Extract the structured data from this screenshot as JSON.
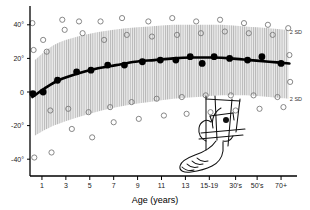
{
  "chart_data": {
    "type": "scatter",
    "title": "",
    "xlabel": "Age (years)",
    "ylabel": "",
    "xlim": [
      0,
      11
    ],
    "ylim": [
      -50,
      50
    ],
    "grid": false,
    "legend_position": "right",
    "x_tick_labels": [
      "1",
      "3",
      "5",
      "7",
      "9",
      "11",
      "13",
      "15-19",
      "30's",
      "50's",
      "70+"
    ],
    "x_tick_positions": [
      0.5,
      1.5,
      2.5,
      3.5,
      4.5,
      5.5,
      6.5,
      7.5,
      8.6,
      9.5,
      10.5
    ],
    "y_tick_labels": [
      "40°",
      "20°",
      "0",
      "-20°",
      "-40°"
    ],
    "y_tick_values": [
      40,
      20,
      0,
      -20,
      -40
    ],
    "annotations": [
      {
        "text": "2 SD",
        "x": 10.7,
        "y": 36,
        "name": "upper-2sd-label"
      },
      {
        "text": "2 SD",
        "x": 10.7,
        "y": -4,
        "name": "lower-2sd-label"
      }
    ],
    "band": {
      "name": "two-sd-band",
      "fill": "#e8e8e8",
      "hatch": "vertical-lines",
      "hatch_color": "#b9b9b9",
      "upper": [
        {
          "x": 0.2,
          "y": 19
        },
        {
          "x": 1.0,
          "y": 28
        },
        {
          "x": 2.0,
          "y": 33
        },
        {
          "x": 3.0,
          "y": 36
        },
        {
          "x": 4.0,
          "y": 38
        },
        {
          "x": 5.0,
          "y": 39
        },
        {
          "x": 6.0,
          "y": 40
        },
        {
          "x": 7.0,
          "y": 40
        },
        {
          "x": 8.0,
          "y": 40
        },
        {
          "x": 9.0,
          "y": 39
        },
        {
          "x": 10.0,
          "y": 38
        },
        {
          "x": 10.8,
          "y": 37
        }
      ],
      "lower": [
        {
          "x": 0.2,
          "y": -26
        },
        {
          "x": 1.0,
          "y": -20
        },
        {
          "x": 2.0,
          "y": -15
        },
        {
          "x": 3.0,
          "y": -11
        },
        {
          "x": 4.0,
          "y": -8
        },
        {
          "x": 5.0,
          "y": -6
        },
        {
          "x": 6.0,
          "y": -4
        },
        {
          "x": 7.0,
          "y": -3
        },
        {
          "x": 8.0,
          "y": -2
        },
        {
          "x": 9.0,
          "y": -2
        },
        {
          "x": 10.0,
          "y": -3
        },
        {
          "x": 10.8,
          "y": -4
        }
      ]
    },
    "series": [
      {
        "name": "mean-curve",
        "type": "line",
        "color": "#000000",
        "linewidth": 2.6,
        "points": [
          {
            "x": 0.1,
            "y": -3
          },
          {
            "x": 0.6,
            "y": 2
          },
          {
            "x": 1.2,
            "y": 7
          },
          {
            "x": 2.0,
            "y": 11
          },
          {
            "x": 2.8,
            "y": 14
          },
          {
            "x": 3.6,
            "y": 16
          },
          {
            "x": 4.4,
            "y": 18
          },
          {
            "x": 5.2,
            "y": 19
          },
          {
            "x": 6.0,
            "y": 20
          },
          {
            "x": 6.8,
            "y": 20.5
          },
          {
            "x": 7.6,
            "y": 20.5
          },
          {
            "x": 8.4,
            "y": 20
          },
          {
            "x": 9.2,
            "y": 19
          },
          {
            "x": 10.0,
            "y": 18
          },
          {
            "x": 10.85,
            "y": 17
          }
        ]
      },
      {
        "name": "mean-data-points",
        "type": "scatter",
        "marker": "filled-circle",
        "color": "#000000",
        "size": 3.4,
        "points": [
          {
            "x": 0.12,
            "y": -1
          },
          {
            "x": 0.55,
            "y": 0
          },
          {
            "x": 1.15,
            "y": 7
          },
          {
            "x": 1.95,
            "y": 12
          },
          {
            "x": 2.55,
            "y": 13
          },
          {
            "x": 3.25,
            "y": 16
          },
          {
            "x": 3.95,
            "y": 16
          },
          {
            "x": 4.7,
            "y": 18
          },
          {
            "x": 5.45,
            "y": 19
          },
          {
            "x": 6.1,
            "y": 19
          },
          {
            "x": 6.7,
            "y": 21
          },
          {
            "x": 7.2,
            "y": 17
          },
          {
            "x": 7.7,
            "y": 21
          },
          {
            "x": 8.35,
            "y": 20
          },
          {
            "x": 9.1,
            "y": 19
          },
          {
            "x": 9.7,
            "y": 21
          },
          {
            "x": 10.5,
            "y": 17
          }
        ]
      },
      {
        "name": "individual-observations",
        "type": "scatter",
        "marker": "open-circle",
        "color": "#7a7a7a",
        "size": 2.6,
        "points": [
          {
            "x": 0.1,
            "y": 41
          },
          {
            "x": 0.15,
            "y": 25
          },
          {
            "x": 0.18,
            "y": -39
          },
          {
            "x": 0.55,
            "y": 31
          },
          {
            "x": 0.7,
            "y": 24
          },
          {
            "x": 0.85,
            "y": -11
          },
          {
            "x": 0.9,
            "y": -36
          },
          {
            "x": 1.35,
            "y": 43
          },
          {
            "x": 1.45,
            "y": 37
          },
          {
            "x": 1.6,
            "y": -10
          },
          {
            "x": 1.75,
            "y": -22
          },
          {
            "x": 2.05,
            "y": 42
          },
          {
            "x": 2.2,
            "y": 35
          },
          {
            "x": 2.45,
            "y": -12
          },
          {
            "x": 2.6,
            "y": -27
          },
          {
            "x": 2.95,
            "y": 42
          },
          {
            "x": 3.1,
            "y": 31
          },
          {
            "x": 3.35,
            "y": -9
          },
          {
            "x": 3.5,
            "y": -18
          },
          {
            "x": 3.85,
            "y": 44
          },
          {
            "x": 4.05,
            "y": 34
          },
          {
            "x": 4.25,
            "y": -6
          },
          {
            "x": 4.55,
            "y": -16
          },
          {
            "x": 4.95,
            "y": 42
          },
          {
            "x": 5.1,
            "y": 33
          },
          {
            "x": 5.3,
            "y": -4
          },
          {
            "x": 5.6,
            "y": -14
          },
          {
            "x": 5.95,
            "y": 44
          },
          {
            "x": 6.15,
            "y": 34
          },
          {
            "x": 6.35,
            "y": -3
          },
          {
            "x": 6.55,
            "y": -13
          },
          {
            "x": 6.95,
            "y": 42
          },
          {
            "x": 7.15,
            "y": 35
          },
          {
            "x": 7.35,
            "y": -2
          },
          {
            "x": 7.55,
            "y": -12
          },
          {
            "x": 7.95,
            "y": 43
          },
          {
            "x": 8.15,
            "y": 36
          },
          {
            "x": 8.4,
            "y": -2
          },
          {
            "x": 8.6,
            "y": -11
          },
          {
            "x": 8.95,
            "y": 41
          },
          {
            "x": 9.15,
            "y": 35
          },
          {
            "x": 9.35,
            "y": -2
          },
          {
            "x": 9.6,
            "y": -10
          },
          {
            "x": 9.95,
            "y": 40
          },
          {
            "x": 10.15,
            "y": 34
          },
          {
            "x": 10.35,
            "y": -3
          },
          {
            "x": 10.6,
            "y": -9
          },
          {
            "x": 10.8,
            "y": 38
          },
          {
            "x": 10.85,
            "y": 22
          },
          {
            "x": 10.88,
            "y": 6
          }
        ]
      }
    ]
  },
  "inset": {
    "name": "leg-foot-angle-diagram",
    "description": "line drawing of lower leg and foot with thigh-foot angle measurement lines",
    "stroke": "#111111"
  }
}
